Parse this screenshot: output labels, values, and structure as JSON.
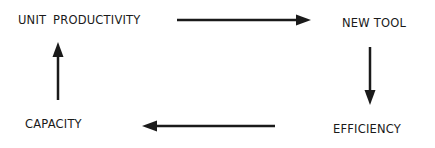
{
  "diagram": {
    "type": "cycle",
    "nodes": [
      {
        "id": "unit_productivity",
        "label": "UNIT  PRODUCTIVITY"
      },
      {
        "id": "new_tool",
        "label": "NEW TOOL"
      },
      {
        "id": "efficiency",
        "label": "EFFICIENCY"
      },
      {
        "id": "capacity",
        "label": "CAPACITY"
      }
    ],
    "edges": [
      {
        "from": "unit_productivity",
        "to": "new_tool",
        "direction": "right"
      },
      {
        "from": "new_tool",
        "to": "efficiency",
        "direction": "down"
      },
      {
        "from": "efficiency",
        "to": "capacity",
        "direction": "left"
      },
      {
        "from": "capacity",
        "to": "unit_productivity",
        "direction": "up"
      }
    ],
    "colors": {
      "text": "#1a1a1a",
      "arrow": "#1a1a1a",
      "background": "#ffffff"
    }
  }
}
